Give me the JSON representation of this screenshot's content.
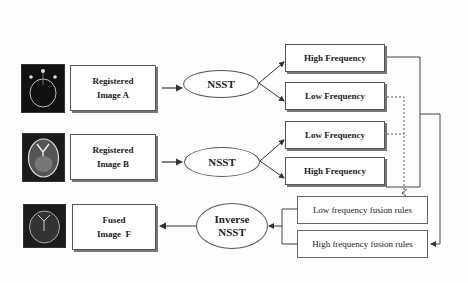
{
  "diagram": {
    "type": "flowchart",
    "colors": {
      "stroke": "#555555",
      "fill": "#ffffff",
      "thumbnail_bg": "#111111"
    },
    "inputs": [
      {
        "id": "A",
        "thumbnail": "brain-scan-a-thumbnail",
        "label_line1": "Registered",
        "label_line2": "Image A"
      },
      {
        "id": "B",
        "thumbnail": "brain-scan-b-thumbnail",
        "label_line1": "Registered",
        "label_line2": "Image B"
      }
    ],
    "transforms": [
      {
        "label": "NSST"
      },
      {
        "label": "NSST"
      }
    ],
    "bands_a": [
      {
        "label": "High Frequency"
      },
      {
        "label": "Low Frequency"
      }
    ],
    "bands_b": [
      {
        "label": "Low Frequency"
      },
      {
        "label": "High Frequency"
      }
    ],
    "fusion_rules": [
      {
        "label": "Low frequency fusion rules"
      },
      {
        "label": "High frequency fusion rules"
      }
    ],
    "inverse": {
      "label_line1": "Inverse",
      "label_line2": "NSST"
    },
    "output": {
      "thumbnail": "fused-brain-scan-thumbnail",
      "label_line1": "Fused",
      "label_line2": "Image  F"
    }
  }
}
